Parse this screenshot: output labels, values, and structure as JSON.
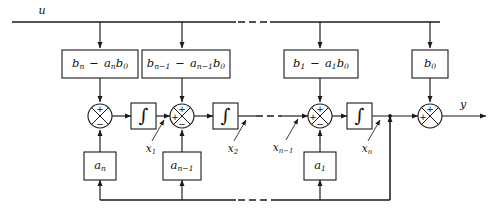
{
  "figure": {
    "type": "control-block-diagram",
    "background_color": "#ffffff",
    "line_color": "#1a1a1a"
  },
  "signals": {
    "input_label": "u",
    "output_label": "y"
  },
  "feedforward_boxes": [
    {
      "id": "ff-n",
      "label_html": "b<sub>n</sub> <span class=\"op\">&minus;</span> a<sub>n</sub>b<sub>0</sub>",
      "label_text": "bn - an b0"
    },
    {
      "id": "ff-n1",
      "label_html": "b<sub>n&minus;1</sub> <span class=\"op\">&minus;</span> a<sub>n&minus;1</sub>b<sub>0</sub>",
      "label_text": "bn-1 - an-1 b0"
    },
    {
      "id": "ff-1",
      "label_html": "b<sub>1</sub> <span class=\"op\">&minus;</span> a<sub>1</sub>b<sub>0</sub>",
      "label_text": "b1 - a1 b0"
    },
    {
      "id": "ff-0",
      "label_html": "b<sub>0</sub>",
      "label_text": "b0"
    }
  ],
  "feedback_boxes": [
    {
      "id": "fb-n",
      "label_html": "a<sub>n</sub>",
      "label_text": "an"
    },
    {
      "id": "fb-n1",
      "label_html": "a<sub>n&minus;1</sub>",
      "label_text": "an-1"
    },
    {
      "id": "fb-1",
      "label_html": "a<sub>1</sub>",
      "label_text": "a1"
    }
  ],
  "integrators": [
    {
      "id": "int-1",
      "glyph": "∫",
      "output_state_html": "x<sub>1</sub>",
      "output_state_text": "x1"
    },
    {
      "id": "int-2",
      "glyph": "∫",
      "output_state_html": "x<sub>2</sub>",
      "output_state_text": "x2"
    },
    {
      "id": "int-n",
      "glyph": "∫",
      "output_state_html": "x<sub>n</sub>",
      "output_state_text": "xn"
    }
  ],
  "state_labels": [
    {
      "id": "x1",
      "label_html": "x<sub>1</sub>",
      "label_text": "x1"
    },
    {
      "id": "x2",
      "label_html": "x<sub>2</sub>",
      "label_text": "x2"
    },
    {
      "id": "xn1",
      "label_html": "x<sub>n&minus;1</sub>",
      "label_text": "xn-1"
    },
    {
      "id": "xn",
      "label_html": "x<sub>n</sub>",
      "label_text": "xn"
    }
  ],
  "summing_junctions": [
    {
      "id": "sum-1",
      "signs": {
        "top": "+",
        "bottom": "−",
        "left": "",
        "right": ""
      }
    },
    {
      "id": "sum-2",
      "signs": {
        "top": "+",
        "bottom": "−",
        "left": "+",
        "right": ""
      }
    },
    {
      "id": "sum-3",
      "signs": {
        "top": "+",
        "bottom": "−",
        "left": "+",
        "right": ""
      }
    },
    {
      "id": "sum-out",
      "signs": {
        "top": "+",
        "bottom": "",
        "left": "+",
        "right": ""
      }
    }
  ],
  "continuation": {
    "style": "dashed",
    "meaning": "repeated stages omitted"
  }
}
